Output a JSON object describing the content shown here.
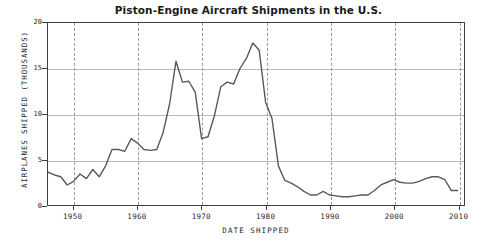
{
  "chart_data": {
    "type": "line",
    "title": "Piston-Engine Aircraft Shipments in the U.S.",
    "xlabel": "DATE SHIPPED",
    "ylabel": "AIRPLANES SHIPPED (THOUSANDS)",
    "xlim": [
      1946,
      2011
    ],
    "ylim": [
      0,
      20
    ],
    "grid": "horizontal-solid + vertical-dashed",
    "legend": "none",
    "line_color": "#595959",
    "xticks": [
      1950,
      1960,
      1970,
      1980,
      1990,
      2000,
      2010
    ],
    "xtick_labels": [
      "1950",
      "1960",
      "1970",
      "1980",
      "1990",
      "2000",
      "2010"
    ],
    "yticks": [
      0,
      5,
      10,
      15,
      20
    ],
    "ytick_labels": [
      "0",
      "5",
      "10",
      "15",
      "20"
    ],
    "x": [
      1946,
      1947,
      1948,
      1949,
      1950,
      1951,
      1952,
      1953,
      1954,
      1955,
      1956,
      1957,
      1958,
      1959,
      1960,
      1961,
      1962,
      1963,
      1964,
      1965,
      1966,
      1967,
      1968,
      1969,
      1970,
      1971,
      1972,
      1973,
      1974,
      1975,
      1976,
      1977,
      1978,
      1979,
      1980,
      1981,
      1982,
      1983,
      1984,
      1985,
      1986,
      1987,
      1988,
      1989,
      1990,
      1991,
      1992,
      1993,
      1994,
      1995,
      1996,
      1997,
      1998,
      1999,
      2000,
      2001,
      2002,
      2003,
      2004,
      2005,
      2006,
      2007,
      2008,
      2009,
      2010
    ],
    "y": [
      3.6,
      3.3,
      3.1,
      2.2,
      2.6,
      3.4,
      2.9,
      3.9,
      3.1,
      4.3,
      6.1,
      6.1,
      5.9,
      7.3,
      6.8,
      6.1,
      6.0,
      6.1,
      8.0,
      11.1,
      15.8,
      13.5,
      13.6,
      12.4,
      7.3,
      7.5,
      9.8,
      13.0,
      13.5,
      13.3,
      15.0,
      16.1,
      17.8,
      17.0,
      11.3,
      9.5,
      4.3,
      2.7,
      2.4,
      2.0,
      1.5,
      1.1,
      1.1,
      1.5,
      1.1,
      1.0,
      0.9,
      0.9,
      1.0,
      1.1,
      1.1,
      1.6,
      2.2,
      2.5,
      2.8,
      2.5,
      2.4,
      2.4,
      2.6,
      2.9,
      3.1,
      3.1,
      2.8,
      1.6,
      1.6
    ]
  },
  "axes": {
    "y_ticks": [
      {
        "label": "20",
        "value": 20
      },
      {
        "label": "15",
        "value": 15
      },
      {
        "label": "10",
        "value": 10
      },
      {
        "label": "5",
        "value": 5
      },
      {
        "label": "0",
        "value": 0
      }
    ],
    "x_ticks": [
      {
        "label": "1950",
        "value": 1950
      },
      {
        "label": "1960",
        "value": 1960
      },
      {
        "label": "1970",
        "value": 1970
      },
      {
        "label": "1980",
        "value": 1980
      },
      {
        "label": "1990",
        "value": 1990
      },
      {
        "label": "2000",
        "value": 2000
      },
      {
        "label": "2010",
        "value": 2010
      }
    ]
  }
}
